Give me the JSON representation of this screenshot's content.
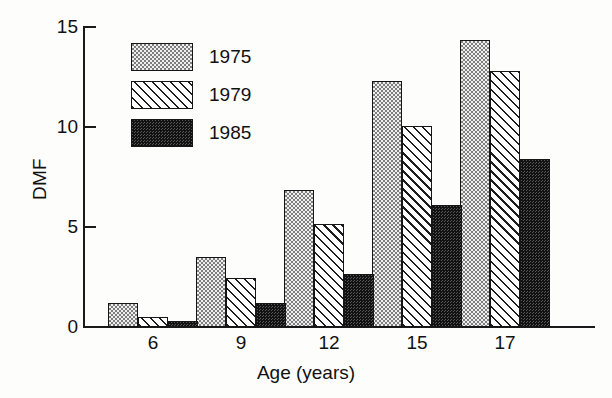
{
  "chart_data": {
    "type": "bar",
    "title": "",
    "xlabel": "Age (years)",
    "ylabel": "DMF",
    "categories": [
      "6",
      "9",
      "12",
      "15",
      "17"
    ],
    "ylim": [
      0,
      15
    ],
    "yticks": [
      0,
      5,
      10,
      15
    ],
    "ytick_labels": [
      "0",
      "5",
      "10",
      "15"
    ],
    "grid": false,
    "legend_position": "upper-left-inside",
    "series": [
      {
        "name": "1975",
        "pattern": "light-dotted",
        "values": [
          1.2,
          3.5,
          6.85,
          12.3,
          14.35
        ]
      },
      {
        "name": "1979",
        "pattern": "diagonal-hatch",
        "values": [
          0.5,
          2.45,
          5.15,
          10.05,
          12.8
        ]
      },
      {
        "name": "1985",
        "pattern": "dark-dotted",
        "values": [
          0.3,
          1.2,
          2.65,
          6.1,
          8.4
        ]
      }
    ]
  },
  "colors": {
    "axis": "#1a1a1a",
    "text": "#111111",
    "background": "#fdfdfb",
    "series_1975_fill": "#efefef",
    "series_1979_fill": "#ffffff",
    "series_1985_fill": "#585858"
  },
  "legend": {
    "items": [
      {
        "label": "1975"
      },
      {
        "label": "1979"
      },
      {
        "label": "1985"
      }
    ]
  }
}
